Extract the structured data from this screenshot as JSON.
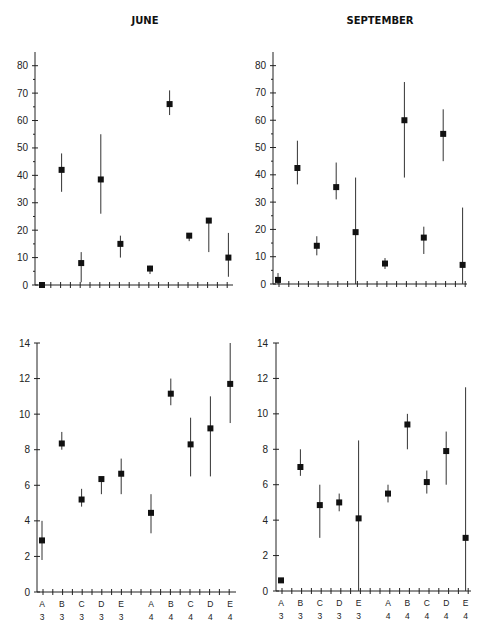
{
  "panel_titles": [
    "JUNE",
    "SEPTEMBER"
  ],
  "categories": [
    {
      "letter": "A",
      "num": "3"
    },
    {
      "letter": "B",
      "num": "3"
    },
    {
      "letter": "C",
      "num": "3"
    },
    {
      "letter": "D",
      "num": "3"
    },
    {
      "letter": "E",
      "num": "3"
    },
    {
      "letter": "A",
      "num": "4"
    },
    {
      "letter": "B",
      "num": "4"
    },
    {
      "letter": "C",
      "num": "4"
    },
    {
      "letter": "D",
      "num": "4"
    },
    {
      "letter": "E",
      "num": "4"
    }
  ],
  "chart_data": [
    {
      "type": "scatter",
      "title": "JUNE",
      "panel": "top-left",
      "xlabel": "",
      "ylabel": "",
      "categories": [
        "A3",
        "B3",
        "C3",
        "D3",
        "E3",
        "A4",
        "B4",
        "C4",
        "D4",
        "E4"
      ],
      "ylim": [
        0,
        85
      ],
      "yticks": [
        0,
        10,
        20,
        30,
        40,
        50,
        60,
        70,
        80
      ],
      "values": [
        0,
        42,
        8,
        38.5,
        15,
        6,
        66,
        18,
        23.5,
        10
      ],
      "err_low": [
        0,
        34,
        1,
        26,
        10,
        4,
        62,
        16,
        12,
        3
      ],
      "err_high": [
        0,
        48,
        12,
        55,
        18,
        7,
        71,
        18.5,
        23.5,
        19
      ]
    },
    {
      "type": "scatter",
      "title": "SEPTEMBER",
      "panel": "top-right",
      "xlabel": "",
      "ylabel": "",
      "categories": [
        "A3",
        "B3",
        "C3",
        "D3",
        "E3",
        "A4",
        "B4",
        "C4",
        "D4",
        "E4"
      ],
      "ylim": [
        0,
        85
      ],
      "yticks": [
        0,
        10,
        20,
        30,
        40,
        50,
        60,
        70,
        80
      ],
      "values": [
        1.5,
        42.5,
        14,
        35.5,
        19,
        7.5,
        60,
        17,
        55,
        7
      ],
      "err_low": [
        0,
        36.5,
        10.5,
        31,
        0,
        5.5,
        39,
        11,
        45,
        0
      ],
      "err_high": [
        4,
        52.5,
        17.5,
        44.5,
        39,
        9.5,
        74,
        21,
        64,
        28
      ]
    },
    {
      "type": "scatter",
      "title": "",
      "panel": "bottom-left",
      "xlabel": "",
      "ylabel": "",
      "categories": [
        "A3",
        "B3",
        "C3",
        "D3",
        "E3",
        "A4",
        "B4",
        "C4",
        "D4",
        "E4"
      ],
      "ylim": [
        0,
        14
      ],
      "yticks": [
        0,
        2,
        4,
        6,
        8,
        10,
        12,
        14
      ],
      "values": [
        2.9,
        8.35,
        5.2,
        6.35,
        6.65,
        4.45,
        11.15,
        8.3,
        9.2,
        11.7
      ],
      "err_low": [
        1.8,
        8.0,
        4.8,
        5.5,
        5.5,
        3.3,
        10.5,
        6.5,
        6.5,
        9.5
      ],
      "err_high": [
        4.0,
        9.0,
        5.8,
        6.35,
        7.5,
        5.5,
        12.0,
        9.8,
        11.0,
        14.0
      ]
    },
    {
      "type": "scatter",
      "title": "",
      "panel": "bottom-right",
      "xlabel": "",
      "ylabel": "",
      "categories": [
        "A3",
        "B3",
        "C3",
        "D3",
        "E3",
        "A4",
        "B4",
        "C4",
        "D4",
        "E4"
      ],
      "ylim": [
        0,
        14
      ],
      "yticks": [
        0,
        2,
        4,
        6,
        8,
        10,
        12,
        14
      ],
      "values": [
        0.6,
        7.0,
        4.85,
        5.0,
        4.1,
        5.5,
        9.4,
        6.15,
        7.9,
        3.0
      ],
      "err_low": [
        0.6,
        6.5,
        3.0,
        4.5,
        0,
        5.0,
        8.0,
        5.5,
        6.0,
        0
      ],
      "err_high": [
        0.6,
        8.0,
        6.0,
        5.5,
        8.5,
        6.0,
        10.0,
        6.8,
        9.0,
        11.5
      ]
    }
  ]
}
